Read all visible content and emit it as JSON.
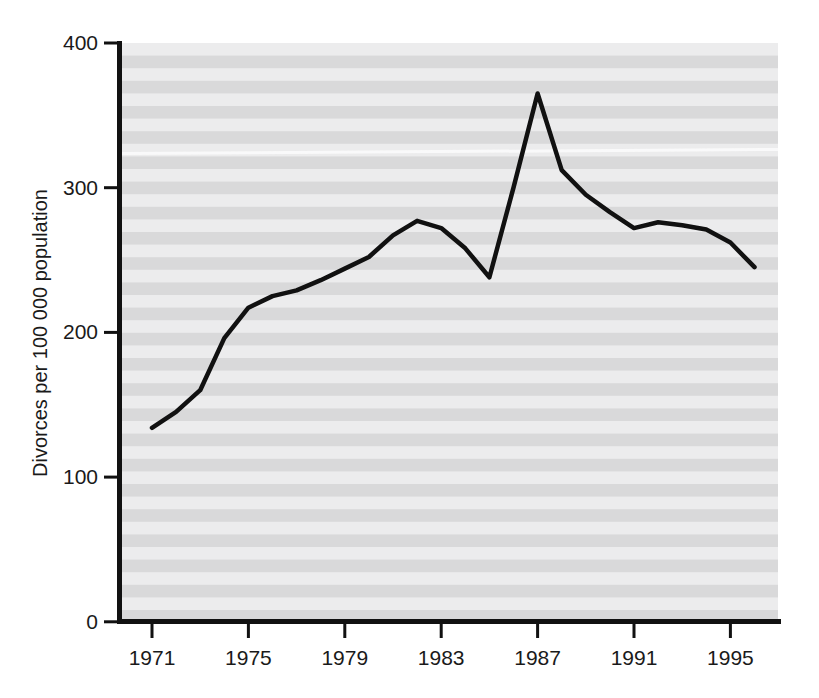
{
  "chart_data": {
    "type": "line",
    "title": "",
    "subtitle": "",
    "xlabel": "",
    "ylabel": "Divorces per 100 000 population",
    "x": [
      1971,
      1972,
      1973,
      1974,
      1975,
      1976,
      1977,
      1978,
      1979,
      1980,
      1981,
      1982,
      1983,
      1984,
      1985,
      1986,
      1987,
      1988,
      1989,
      1990,
      1991,
      1992,
      1993,
      1994,
      1995,
      1996
    ],
    "values": [
      134,
      145,
      160,
      196,
      217,
      225,
      229,
      236,
      244,
      252,
      267,
      277,
      272,
      258,
      238,
      300,
      365,
      312,
      295,
      283,
      272,
      276,
      274,
      271,
      262,
      245
    ],
    "series": [
      {
        "name": "Divorces per 100 000 population",
        "values": [
          134,
          145,
          160,
          196,
          217,
          225,
          229,
          236,
          244,
          252,
          267,
          277,
          272,
          258,
          238,
          300,
          365,
          312,
          295,
          283,
          272,
          276,
          274,
          271,
          262,
          245
        ]
      }
    ],
    "xlim": [
      1971,
      1996
    ],
    "ylim": [
      0,
      400
    ],
    "ytick_labels": [
      "0",
      "100",
      "200",
      "300",
      "400"
    ],
    "ytick_values": [
      0,
      100,
      200,
      300,
      400
    ],
    "xtick_labels": [
      "1971",
      "1975",
      "1979",
      "1983",
      "1987",
      "1991",
      "1995"
    ],
    "xtick_values": [
      1971,
      1975,
      1979,
      1983,
      1987,
      1991,
      1995
    ],
    "grid": false,
    "legend": "none",
    "line_color": "#111111",
    "line_width": 4,
    "plot_background": "striped-gray",
    "background_stripe_light": "#ececed",
    "background_stripe_dark": "#d8d8d9",
    "axis_color": "#111111"
  },
  "axes": {
    "y_label": "Divorces per 100 000 population",
    "x_label": ""
  }
}
